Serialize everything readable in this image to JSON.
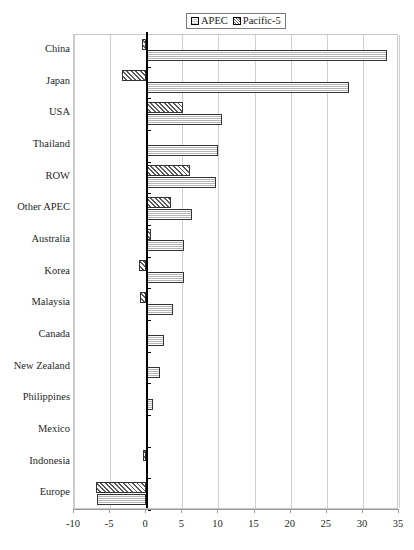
{
  "chart_data": {
    "type": "bar",
    "orientation": "horizontal",
    "title": "",
    "xlabel": "",
    "ylabel": "",
    "xlim": [
      -10,
      35
    ],
    "xticks": [
      -10,
      -5,
      0,
      5,
      10,
      15,
      20,
      25,
      30,
      35
    ],
    "xtick_labels": [
      "-10",
      "-5",
      "0",
      "5",
      "10",
      "15",
      "20",
      "25",
      "30",
      "35"
    ],
    "grid": true,
    "legend_position": "top-center",
    "categories": [
      "China",
      "Japan",
      "USA",
      "Thailand",
      "ROW",
      "Other APEC",
      "Australia",
      "Korea",
      "Malaysia",
      "Canada",
      "New Zealand",
      "Philippines",
      "Mexico",
      "Indonesia",
      "Europe"
    ],
    "series": [
      {
        "name": "Pacific-5",
        "pattern": "diagonal-hatch",
        "values": [
          -0.6,
          -3.3,
          5.1,
          0.2,
          6.0,
          3.5,
          0.7,
          -1.0,
          -0.9,
          0.1,
          0.2,
          0.1,
          0.05,
          -0.5,
          -7.0
        ]
      },
      {
        "name": "APEC",
        "pattern": "horizontal-lines",
        "values": [
          33.4,
          28.1,
          10.5,
          9.9,
          9.7,
          6.4,
          5.2,
          5.3,
          3.7,
          2.4,
          1.9,
          0.9,
          0.2,
          0.1,
          -6.8
        ]
      }
    ]
  },
  "legend": {
    "entries": [
      {
        "label": "APEC",
        "swatch": "horizontal-lines-swatch"
      },
      {
        "label": "Pacific-5",
        "swatch": "diagonal-hatch-swatch"
      }
    ]
  },
  "colors": {
    "background": "#ffffff",
    "axis": "#000000",
    "grid": "#d0d0d0",
    "bar_outline": "#333333"
  }
}
